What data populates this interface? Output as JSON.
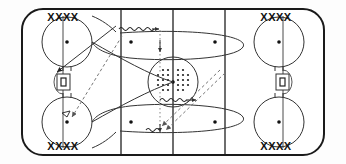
{
  "diagram": {
    "type": "hockey-rink-drill",
    "sport": "ice hockey",
    "colors": {
      "ice": "#ffffff",
      "board_line": "#1a1a1a",
      "red_line": "#555555",
      "blue_line": "#555555",
      "player_mark": "#111111",
      "path_solid": "#333333",
      "path_dashed": "#777777",
      "puck_dot": "#222222"
    },
    "rink": {
      "boards_label": "rink-boards",
      "center_line_label": "center-red-line",
      "blue_lines": [
        "blue-line-left",
        "blue-line-right"
      ],
      "goal_lines": [
        "goal-line-left",
        "goal-line-right"
      ],
      "center_circle_label": "center-faceoff-circle",
      "nets": [
        "goal-net-left",
        "goal-net-right"
      ]
    },
    "player_groups": [
      {
        "id": "group-top-left",
        "label": "XXXX",
        "count": 4,
        "corner": "top-left"
      },
      {
        "id": "group-top-right",
        "label": "XXXX",
        "count": 4,
        "corner": "top-right"
      },
      {
        "id": "group-bottom-left",
        "label": "XXXX",
        "count": 4,
        "corner": "bottom-left"
      },
      {
        "id": "group-bottom-right",
        "label": "XXXX",
        "count": 4,
        "corner": "bottom-right"
      }
    ],
    "faceoff_circles": [
      {
        "id": "faceoff-circle-top-left",
        "zone": "defensive-zone-left"
      },
      {
        "id": "faceoff-circle-bottom-left",
        "zone": "defensive-zone-left"
      },
      {
        "id": "faceoff-circle-top-right",
        "zone": "defensive-zone-right"
      },
      {
        "id": "faceoff-circle-bottom-right",
        "zone": "defensive-zone-right"
      }
    ],
    "faceoff_dots": [
      {
        "id": "dot-top-left"
      },
      {
        "id": "dot-bottom-left"
      },
      {
        "id": "dot-top-right"
      },
      {
        "id": "dot-bottom-right"
      },
      {
        "id": "dot-neutral-top-left"
      },
      {
        "id": "dot-neutral-top-right"
      },
      {
        "id": "dot-neutral-bottom-left"
      },
      {
        "id": "dot-neutral-bottom-right"
      },
      {
        "id": "dot-center"
      }
    ],
    "pucks": {
      "label": "puck-pile-center",
      "description": "pile of pucks at center ice",
      "rows": 5,
      "columns": 6,
      "total": 30
    },
    "movement_paths": [
      {
        "id": "path-skate-top-left-diagonal",
        "style": "solid",
        "arrow": true,
        "meaning": "skate with puck"
      },
      {
        "id": "path-skate-loop-top",
        "style": "solid",
        "arrow": false,
        "meaning": "skating loop through neutral zone"
      },
      {
        "id": "path-skate-loop-bottom",
        "style": "solid",
        "arrow": false,
        "meaning": "skating loop through neutral zone"
      },
      {
        "id": "path-pass-top-left-diagonal",
        "style": "dashed",
        "arrow": true,
        "meaning": "pass"
      },
      {
        "id": "path-pass-bottom-right-diagonal",
        "style": "dashed",
        "arrow": true,
        "meaning": "pass"
      },
      {
        "id": "path-shot-top",
        "style": "wavy",
        "arrow": true,
        "meaning": "shot"
      },
      {
        "id": "path-shot-bottom",
        "style": "wavy",
        "arrow": true,
        "meaning": "shot"
      },
      {
        "id": "path-dotted-vertical-upper",
        "style": "dotted",
        "arrow": true,
        "meaning": "puck transfer lane"
      },
      {
        "id": "path-dotted-vertical-lower",
        "style": "dotted",
        "arrow": true,
        "meaning": "puck transfer lane"
      }
    ]
  }
}
